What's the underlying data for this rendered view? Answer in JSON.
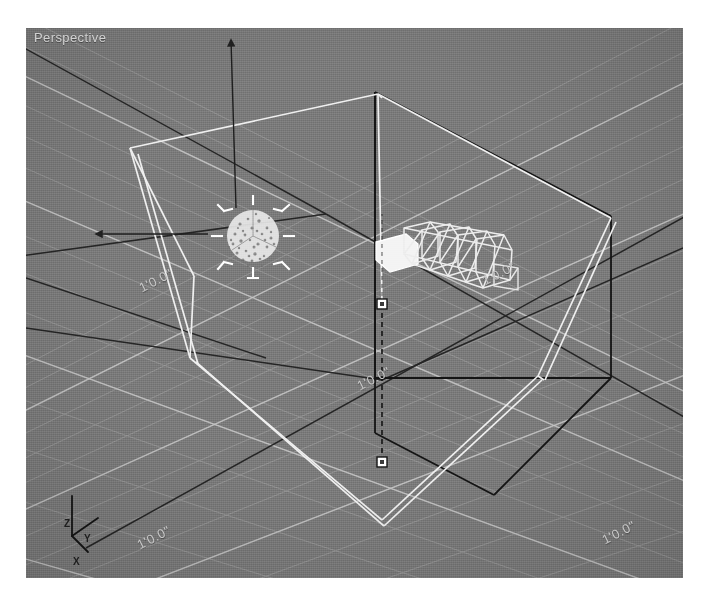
{
  "app": {
    "kind": "3d-modeling-viewport",
    "page_background": "#ffffff"
  },
  "viewport": {
    "label": "Perspective",
    "background_color": "#7b7b7b",
    "grid_line_color": "#9d9d9d",
    "grid_major_color": "#b4b4b4",
    "wireframe_color": "#f2f2f2",
    "dark_wire_color": "#1a1a1a",
    "selection_color": "#ffffff"
  },
  "grid_labels": [
    {
      "id": "grid-label-left",
      "text": "1'0.0\""
    },
    {
      "id": "grid-label-center",
      "text": "1'0.0\""
    },
    {
      "id": "grid-label-right",
      "text": "1'0.0\""
    },
    {
      "id": "grid-label-bottom-left",
      "text": "1'0.0\""
    },
    {
      "id": "grid-label-bottom-right",
      "text": "1'0.0\""
    }
  ],
  "axis_tripod": {
    "z": "Z",
    "y": "Y",
    "x": "X"
  },
  "objects": {
    "particle_sphere": {
      "name": "particle-emitter-sphere",
      "selected": true,
      "center_x": 227,
      "center_y": 208,
      "radius": 26
    },
    "light_rig": {
      "name": "light-rig-wireframe",
      "center_x": 430,
      "center_y": 232
    },
    "room_box": {
      "name": "room-wireframe-box"
    },
    "move_gizmo": {
      "name": "move-gizmo",
      "axes": [
        "up",
        "left"
      ]
    },
    "pivot_handles": [
      {
        "name": "pivot-handle-upper",
        "x": 356,
        "y": 276
      },
      {
        "name": "pivot-handle-lower",
        "x": 356,
        "y": 434
      }
    ]
  }
}
